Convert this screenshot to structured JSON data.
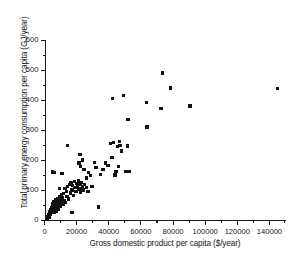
{
  "chart_data": {
    "type": "scatter",
    "title": "",
    "xlabel": "Gross domestic product per capita ($/year)",
    "ylabel": "Total primary energy consumption  per capita (GJ/year)",
    "xlim": [
      0,
      150000
    ],
    "ylim": [
      0,
      600
    ],
    "xticks": [
      0,
      20000,
      40000,
      60000,
      80000,
      100000,
      120000,
      140000
    ],
    "xtick_labels": [
      "0",
      "20000",
      "40000",
      "60000",
      "80000",
      "100000",
      "120000",
      "140000"
    ],
    "yticks": [
      0,
      100,
      200,
      300,
      400,
      500,
      600
    ],
    "ytick_labels": [
      "0",
      "100",
      "200",
      "300",
      "400",
      "500",
      "600"
    ],
    "grid": false,
    "legend": null,
    "marker": "square",
    "marker_color": "#111111",
    "points": [
      [
        1200,
        8
      ],
      [
        1600,
        5
      ],
      [
        2100,
        12
      ],
      [
        2400,
        18
      ],
      [
        2800,
        10
      ],
      [
        3000,
        22
      ],
      [
        3200,
        15
      ],
      [
        3500,
        28
      ],
      [
        3800,
        20
      ],
      [
        4000,
        33
      ],
      [
        4300,
        25
      ],
      [
        4600,
        40
      ],
      [
        4800,
        30
      ],
      [
        5000,
        48
      ],
      [
        5200,
        35
      ],
      [
        5400,
        55
      ],
      [
        5600,
        42
      ],
      [
        5800,
        27
      ],
      [
        6000,
        60
      ],
      [
        6200,
        45
      ],
      [
        6500,
        38
      ],
      [
        6800,
        52
      ],
      [
        7000,
        67
      ],
      [
        7200,
        30
      ],
      [
        7500,
        58
      ],
      [
        7800,
        43
      ],
      [
        8000,
        72
      ],
      [
        8300,
        50
      ],
      [
        8600,
        63
      ],
      [
        8900,
        37
      ],
      [
        9200,
        78
      ],
      [
        9500,
        55
      ],
      [
        9800,
        68
      ],
      [
        10000,
        45
      ],
      [
        10400,
        83
      ],
      [
        10800,
        60
      ],
      [
        11200,
        73
      ],
      [
        11600,
        52
      ],
      [
        12000,
        88
      ],
      [
        12400,
        65
      ],
      [
        12800,
        105
      ],
      [
        13200,
        58
      ],
      [
        13600,
        95
      ],
      [
        14000,
        78
      ],
      [
        14500,
        112
      ],
      [
        15000,
        70
      ],
      [
        15500,
        118
      ],
      [
        16000,
        90
      ],
      [
        16500,
        125
      ],
      [
        17000,
        100
      ],
      [
        17500,
        115
      ],
      [
        18000,
        82
      ],
      [
        18500,
        128
      ],
      [
        19000,
        108
      ],
      [
        19500,
        95
      ],
      [
        20000,
        122
      ],
      [
        20500,
        112
      ],
      [
        21000,
        130
      ],
      [
        21500,
        103
      ],
      [
        22000,
        118
      ],
      [
        22500,
        92
      ],
      [
        23000,
        125
      ],
      [
        23500,
        110
      ],
      [
        24000,
        100
      ],
      [
        25000,
        118
      ],
      [
        26000,
        108
      ],
      [
        27000,
        95
      ],
      [
        4800,
        160
      ],
      [
        6300,
        158
      ],
      [
        9200,
        105
      ],
      [
        11000,
        155
      ],
      [
        14500,
        248
      ],
      [
        15800,
        118
      ],
      [
        17000,
        25
      ],
      [
        21500,
        190
      ],
      [
        22000,
        218
      ],
      [
        22500,
        178
      ],
      [
        23500,
        200
      ],
      [
        24500,
        168
      ],
      [
        26000,
        140
      ],
      [
        27500,
        158
      ],
      [
        28500,
        148
      ],
      [
        29500,
        112
      ],
      [
        31000,
        192
      ],
      [
        32000,
        175
      ],
      [
        33500,
        43
      ],
      [
        35000,
        152
      ],
      [
        36500,
        168
      ],
      [
        38000,
        190
      ],
      [
        39500,
        182
      ],
      [
        41000,
        255
      ],
      [
        42000,
        208
      ],
      [
        42500,
        405
      ],
      [
        43000,
        258
      ],
      [
        44000,
        150
      ],
      [
        44500,
        162
      ],
      [
        45500,
        245
      ],
      [
        46000,
        178
      ],
      [
        46500,
        262
      ],
      [
        47000,
        248
      ],
      [
        48000,
        230
      ],
      [
        49000,
        415
      ],
      [
        50500,
        162
      ],
      [
        51500,
        247
      ],
      [
        52000,
        335
      ],
      [
        52500,
        162
      ],
      [
        63500,
        392
      ],
      [
        63800,
        310
      ],
      [
        72500,
        372
      ],
      [
        73500,
        490
      ],
      [
        78500,
        440
      ],
      [
        90500,
        380
      ],
      [
        145000,
        438
      ]
    ]
  }
}
